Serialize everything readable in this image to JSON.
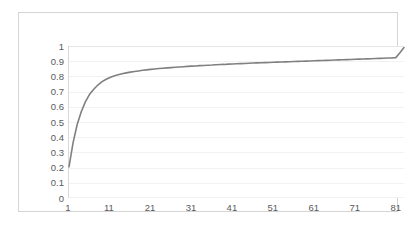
{
  "chart_data": {
    "type": "line",
    "title": "",
    "subtitle": "",
    "xlabel": "",
    "ylabel": "",
    "grid": "horizontal",
    "legend": "none",
    "xlim": [
      1,
      83
    ],
    "ylim": [
      0,
      1
    ],
    "x_tick_labels": [
      "1",
      "11",
      "21",
      "31",
      "41",
      "51",
      "61",
      "71",
      "81"
    ],
    "x_ticks": [
      1,
      11,
      21,
      31,
      41,
      51,
      61,
      71,
      81
    ],
    "y_tick_labels": [
      "1",
      "0.9",
      "0.8",
      "0.7",
      "0.6",
      "0.5",
      "0.4",
      "0.3",
      "0.2",
      "0.1",
      "0"
    ],
    "y_ticks": [
      1,
      0.9,
      0.8,
      0.7,
      0.6,
      0.5,
      0.4,
      0.3,
      0.2,
      0.1,
      0
    ],
    "series": [
      {
        "name": "series-1",
        "color": "#808080",
        "line_width": 1.6,
        "x": [
          1,
          2,
          3,
          4,
          5,
          6,
          7,
          8,
          9,
          10,
          11,
          12,
          13,
          14,
          15,
          16,
          17,
          18,
          19,
          20,
          21,
          22,
          23,
          24,
          25,
          26,
          27,
          28,
          29,
          30,
          31,
          32,
          33,
          34,
          35,
          36,
          37,
          38,
          39,
          40,
          41,
          42,
          43,
          44,
          45,
          46,
          47,
          48,
          49,
          50,
          51,
          52,
          53,
          54,
          55,
          56,
          57,
          58,
          59,
          60,
          61,
          62,
          63,
          64,
          65,
          66,
          67,
          68,
          69,
          70,
          71,
          72,
          73,
          74,
          75,
          76,
          77,
          78,
          79,
          80,
          81,
          82,
          83
        ],
        "values": [
          0.2,
          0.36,
          0.48,
          0.565,
          0.63,
          0.678,
          0.712,
          0.74,
          0.762,
          0.778,
          0.791,
          0.801,
          0.809,
          0.816,
          0.822,
          0.827,
          0.831,
          0.835,
          0.839,
          0.842,
          0.845,
          0.848,
          0.851,
          0.853,
          0.855,
          0.857,
          0.859,
          0.861,
          0.863,
          0.865,
          0.867,
          0.868,
          0.87,
          0.871,
          0.873,
          0.874,
          0.876,
          0.877,
          0.878,
          0.88,
          0.881,
          0.882,
          0.883,
          0.884,
          0.886,
          0.887,
          0.888,
          0.889,
          0.89,
          0.891,
          0.892,
          0.893,
          0.894,
          0.895,
          0.896,
          0.897,
          0.898,
          0.899,
          0.9,
          0.901,
          0.902,
          0.903,
          0.904,
          0.905,
          0.906,
          0.907,
          0.908,
          0.909,
          0.91,
          0.911,
          0.912,
          0.913,
          0.914,
          0.915,
          0.916,
          0.917,
          0.918,
          0.919,
          0.92,
          0.921,
          0.923,
          0.955,
          0.99
        ]
      }
    ]
  }
}
